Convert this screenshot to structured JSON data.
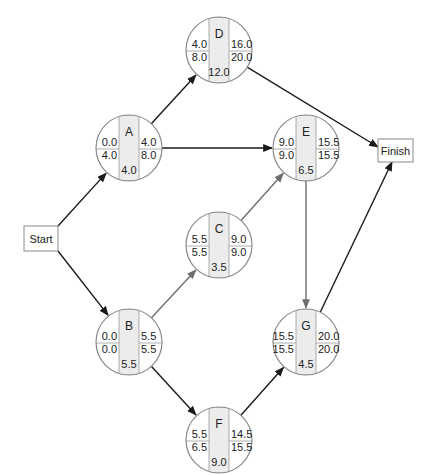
{
  "diagram": {
    "type": "activity-on-node network (critical path)",
    "terminals": {
      "start": {
        "label": "Start",
        "x": 24,
        "y": 226,
        "w": 34,
        "h": 25
      },
      "finish": {
        "label": "Finish",
        "x": 378,
        "y": 139,
        "w": 35,
        "h": 23
      }
    },
    "nodes": [
      {
        "id": "D",
        "cx": 219,
        "cy": 50,
        "es": "4.0",
        "lf": "8.0",
        "ef": "16.0",
        "ls_right": "20.0",
        "duration": "12.0"
      },
      {
        "id": "A",
        "cx": 129,
        "cy": 148,
        "es": "0.0",
        "lf": "4.0",
        "ef": "4.0",
        "ls_right": "8.0",
        "duration": "4.0"
      },
      {
        "id": "E",
        "cx": 306,
        "cy": 148,
        "es": "9.0",
        "lf": "9.0",
        "ef": "15.5",
        "ls_right": "15.5",
        "duration": "6.5"
      },
      {
        "id": "C",
        "cx": 219,
        "cy": 245,
        "es": "5.5",
        "lf": "5.5",
        "ef": "9.0",
        "ls_right": "9.0",
        "duration": "3.5"
      },
      {
        "id": "B",
        "cx": 129,
        "cy": 342,
        "es": "0.0",
        "lf": "0.0",
        "ef": "5.5",
        "ls_right": "5.5",
        "duration": "5.5"
      },
      {
        "id": "G",
        "cx": 306,
        "cy": 342,
        "es": "15.5",
        "lf": "15.5",
        "ef": "20.0",
        "ls_right": "20.0",
        "duration": "4.5"
      },
      {
        "id": "F",
        "cx": 219,
        "cy": 440,
        "es": "5.5",
        "lf": "6.5",
        "ef": "14.5",
        "ls_right": "15.5",
        "duration": "9.0"
      }
    ],
    "edges": [
      {
        "from": "Start",
        "to": "A",
        "color": "#1a1a1a"
      },
      {
        "from": "Start",
        "to": "B",
        "color": "#1a1a1a"
      },
      {
        "from": "A",
        "to": "D",
        "color": "#1a1a1a"
      },
      {
        "from": "A",
        "to": "E",
        "color": "#1a1a1a"
      },
      {
        "from": "D",
        "to": "Finish",
        "color": "#1a1a1a"
      },
      {
        "from": "B",
        "to": "C",
        "color": "#6e6e6e"
      },
      {
        "from": "B",
        "to": "F",
        "color": "#1a1a1a"
      },
      {
        "from": "C",
        "to": "E",
        "color": "#6e6e6e"
      },
      {
        "from": "E",
        "to": "G",
        "color": "#6e6e6e"
      },
      {
        "from": "F",
        "to": "G",
        "color": "#1a1a1a"
      },
      {
        "from": "G",
        "to": "Finish",
        "color": "#1a1a1a"
      }
    ],
    "colors": {
      "node_outline": "#8a8a8a",
      "node_center_fill": "#ececec",
      "divider": "#9a9a9a",
      "critical_edge": "#6e6e6e",
      "edge": "#1a1a1a"
    }
  }
}
